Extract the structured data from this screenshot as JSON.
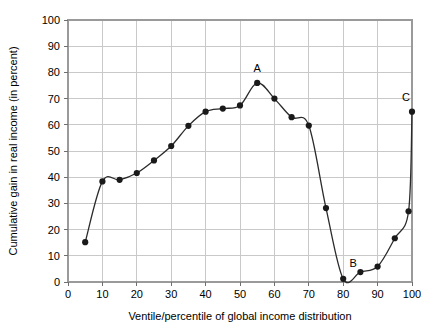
{
  "chart_data": {
    "type": "line",
    "title": "",
    "subtitle": "",
    "xlabel": "Ventile/percentile of global income distribution",
    "ylabel": "Cumulative gain in real income (in percent)",
    "xlim": [
      0,
      100
    ],
    "ylim": [
      0,
      100
    ],
    "grid": true,
    "legend": "none",
    "x_ticks": [
      0,
      10,
      20,
      30,
      40,
      50,
      60,
      70,
      80,
      90,
      100
    ],
    "y_ticks": [
      0,
      10,
      20,
      30,
      40,
      50,
      60,
      70,
      80,
      90,
      100
    ],
    "x_tick_labels": [
      "0",
      "10",
      "20",
      "30",
      "40",
      "50",
      "60",
      "70",
      "80",
      "90",
      "100"
    ],
    "y_tick_labels": [
      "0",
      "10",
      "20",
      "30",
      "40",
      "50",
      "60",
      "70",
      "80",
      "90",
      "100"
    ],
    "series": [
      {
        "name": "Cumulative real income gain",
        "marker": "filled-circle",
        "color": "#1a1a1a",
        "x": [
          5,
          10,
          15,
          20,
          25,
          30,
          35,
          40,
          45,
          50,
          55,
          60,
          65,
          70,
          75,
          80,
          85,
          90,
          95,
          99,
          100
        ],
        "values": [
          15.2,
          38.4,
          39.0,
          41.6,
          46.4,
          51.9,
          59.6,
          65.0,
          66.2,
          67.4,
          76.0,
          70.0,
          62.9,
          59.7,
          28.2,
          1.2,
          3.8,
          5.9,
          16.7,
          27.0,
          65.0
        ]
      }
    ],
    "annotations": [
      {
        "label": "A",
        "x": 55,
        "y": 76.0,
        "dx": 0,
        "dy": -11
      },
      {
        "label": "B",
        "x": 80,
        "y": 1.2,
        "dx": 10,
        "dy": -12
      },
      {
        "label": "C",
        "x": 100,
        "y": 65.0,
        "dx": -6,
        "dy": -11
      }
    ]
  },
  "colors": {
    "line": "#2b2b2b",
    "marker": "#1a1a1a",
    "grid": "#c9c9c9",
    "frame": "#9a9a9a",
    "text": "#000000",
    "background": "#ffffff"
  }
}
